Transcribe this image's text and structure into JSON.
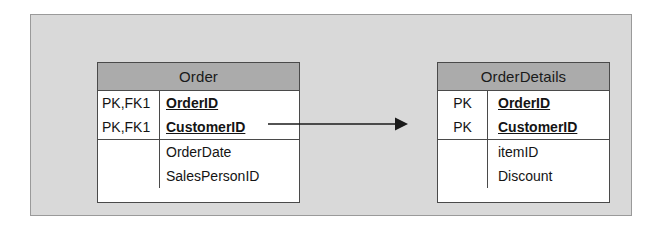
{
  "diagram": {
    "type": "entity-relationship-diagram",
    "background_color": "#d9d9d9",
    "header_color": "#ababab",
    "entity_border_color": "#4a4a4a",
    "entities": [
      {
        "name": "Order",
        "keys": [
          {
            "key": "PK,FK1",
            "attribute": "OrderID",
            "is_primary": true
          },
          {
            "key": "PK,FK1",
            "attribute": "CustomerID",
            "is_primary": true
          }
        ],
        "attributes": [
          {
            "key": "",
            "attribute": "OrderDate",
            "is_primary": false
          },
          {
            "key": "",
            "attribute": "SalesPersonID",
            "is_primary": false
          }
        ]
      },
      {
        "name": "OrderDetails",
        "keys": [
          {
            "key": "PK",
            "attribute": "OrderID",
            "is_primary": true
          },
          {
            "key": "PK",
            "attribute": "CustomerID",
            "is_primary": true
          }
        ],
        "attributes": [
          {
            "key": "",
            "attribute": "itemID",
            "is_primary": false
          },
          {
            "key": "",
            "attribute": "Discount",
            "is_primary": false
          }
        ]
      }
    ],
    "relationship": {
      "from": "Order",
      "to": "OrderDetails",
      "style": "solid-line-with-arrowhead",
      "direction": "right"
    }
  }
}
